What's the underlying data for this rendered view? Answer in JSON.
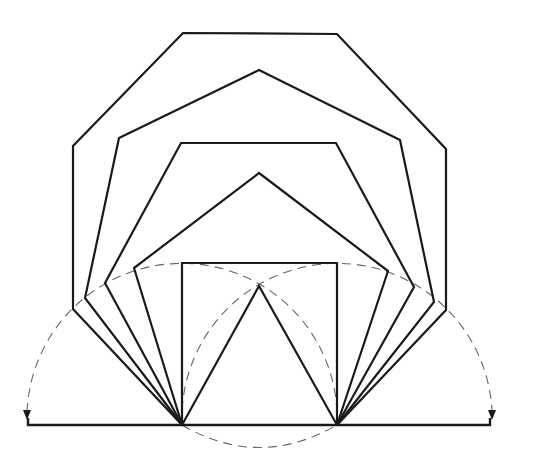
{
  "diagram": {
    "title": "",
    "colors": {
      "line": "#1a1a1a",
      "construction": "#666666",
      "background": "#ffffff"
    },
    "base_line": {
      "from": [
        28,
        425
      ],
      "to": [
        490,
        425
      ]
    },
    "base_points": {
      "A": [
        182,
        425
      ],
      "B": [
        337,
        425
      ]
    },
    "polygons": [
      {
        "name": "triangle",
        "sides": 3,
        "points": [
          [
            182,
            425
          ],
          [
            259,
            286
          ],
          [
            337,
            425
          ]
        ]
      },
      {
        "name": "square",
        "sides": 4,
        "points": [
          [
            182,
            425
          ],
          [
            182,
            263
          ],
          [
            337,
            263
          ],
          [
            337,
            425
          ]
        ]
      },
      {
        "name": "pentagon",
        "sides": 5,
        "points": [
          [
            182,
            425
          ],
          [
            134,
            268
          ],
          [
            259,
            173
          ],
          [
            388,
            271
          ],
          [
            337,
            425
          ]
        ]
      },
      {
        "name": "hexagon",
        "sides": 6,
        "points": [
          [
            182,
            425
          ],
          [
            105,
            283
          ],
          [
            181,
            143
          ],
          [
            336,
            143
          ],
          [
            414,
            287
          ],
          [
            337,
            425
          ]
        ]
      },
      {
        "name": "heptagon",
        "sides": 7,
        "points": [
          [
            182,
            425
          ],
          [
            85,
            298
          ],
          [
            119,
            138
          ],
          [
            259,
            70
          ],
          [
            400,
            140
          ],
          [
            434,
            302
          ],
          [
            337,
            425
          ]
        ]
      },
      {
        "name": "octagon",
        "sides": 8,
        "points": [
          [
            182,
            425
          ],
          [
            73,
            309
          ],
          [
            73,
            146
          ],
          [
            183,
            33
          ],
          [
            337,
            34
          ],
          [
            446,
            149
          ],
          [
            446,
            310
          ],
          [
            337,
            425
          ]
        ]
      }
    ],
    "construction_arcs": [
      {
        "name": "arc-centered-A",
        "center": [
          182,
          425
        ],
        "radius": 155,
        "arrow_end": [
          27,
          418
        ]
      },
      {
        "name": "arc-centered-B",
        "center": [
          337,
          425
        ],
        "radius": 155,
        "arrow_end": [
          492,
          418
        ]
      },
      {
        "name": "arc-lower",
        "through": [
          [
            182,
            425
          ],
          [
            259,
            447
          ],
          [
            337,
            425
          ]
        ]
      }
    ]
  }
}
